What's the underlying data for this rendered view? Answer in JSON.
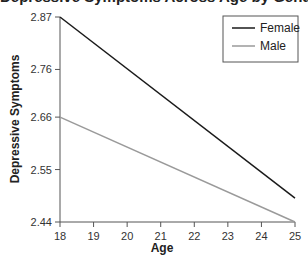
{
  "chart_data": {
    "type": "line",
    "title": "Depressive Symptoms Across Age by Gender",
    "xlabel": "Age",
    "ylabel": "Depressive Symptoms",
    "x": [
      18,
      25
    ],
    "xticks": [
      "18",
      "19",
      "20",
      "21",
      "22",
      "23",
      "24",
      "25"
    ],
    "yticks": [
      "2.44",
      "2.55",
      "2.66",
      "2.76",
      "2.87"
    ],
    "xlim": [
      18,
      25
    ],
    "ylim": [
      2.44,
      2.87
    ],
    "grid": false,
    "legend_position": "upper right",
    "series": [
      {
        "name": "Female",
        "values": [
          2.87,
          2.49
        ],
        "color": "#1a1a1a"
      },
      {
        "name": "Male",
        "values": [
          2.66,
          2.44
        ],
        "color": "#9a9a9a"
      }
    ]
  },
  "legend": {
    "items": [
      {
        "label": "Female"
      },
      {
        "label": "Male"
      }
    ]
  }
}
